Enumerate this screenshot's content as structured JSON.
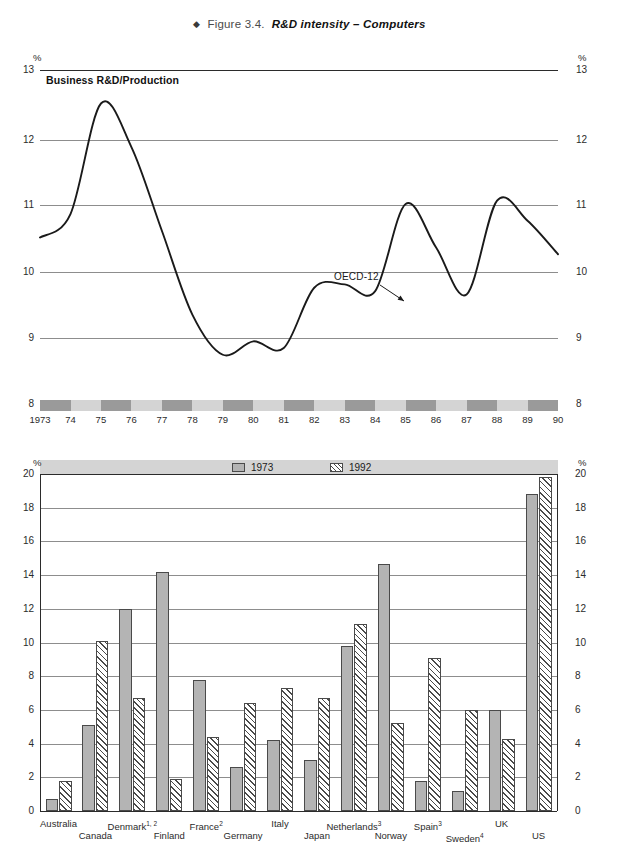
{
  "figure": {
    "bullet": "◆",
    "label": "Figure 3.4.",
    "title": "R&D intensity – Computers"
  },
  "line_panel": {
    "subtitle": "Business R&D/Production",
    "unit": "%",
    "annotation": "OECD-12",
    "y_ticks": [
      "13",
      "12",
      "11",
      "10",
      "9",
      "8"
    ],
    "x_ticks": [
      "1973",
      "74",
      "75",
      "76",
      "77",
      "78",
      "79",
      "80",
      "81",
      "82",
      "83",
      "84",
      "85",
      "86",
      "87",
      "88",
      "89",
      "90"
    ]
  },
  "bar_panel": {
    "unit": "%",
    "y_ticks": [
      "20",
      "18",
      "16",
      "14",
      "12",
      "10",
      "8",
      "6",
      "4",
      "2",
      "0"
    ],
    "legend": [
      {
        "label": "1973",
        "style": "solid"
      },
      {
        "label": "1992",
        "style": "hatch"
      }
    ]
  },
  "colors": {
    "series_1973": "#b4b4b4",
    "series_1992": "#ffffff",
    "hatch": "#4a4a4a",
    "grid": "#8d8d8d",
    "band_dark": "#9a9a9a",
    "band_light": "#d4d4d4",
    "line": "#1a1a1a"
  },
  "chart_data": [
    {
      "type": "line",
      "title": "Business R&D/Production",
      "xlabel": "",
      "ylabel": "%",
      "ylim": [
        8,
        13
      ],
      "xlim": [
        1973,
        1990
      ],
      "grid": true,
      "legend_position": "inline-annotation",
      "series": [
        {
          "name": "OECD-12",
          "x": [
            1973,
            1974,
            1975,
            1976,
            1977,
            1978,
            1979,
            1980,
            1981,
            1982,
            1983,
            1984,
            1985,
            1986,
            1987,
            1988,
            1989,
            1990
          ],
          "values": [
            10.5,
            10.85,
            12.5,
            11.85,
            10.6,
            9.35,
            8.75,
            8.95,
            8.85,
            9.75,
            9.8,
            9.7,
            11.0,
            10.35,
            9.65,
            11.05,
            10.75,
            10.25
          ]
        }
      ]
    },
    {
      "type": "bar",
      "title": "",
      "xlabel": "",
      "ylabel": "%",
      "ylim": [
        0,
        20
      ],
      "grid": true,
      "legend_position": "top",
      "categories": [
        {
          "name": "Australia",
          "note": ""
        },
        {
          "name": "Canada",
          "note": ""
        },
        {
          "name": "Denmark",
          "note": "1, 2"
        },
        {
          "name": "Finland",
          "note": ""
        },
        {
          "name": "France",
          "note": "2"
        },
        {
          "name": "Germany",
          "note": ""
        },
        {
          "name": "Italy",
          "note": ""
        },
        {
          "name": "Japan",
          "note": ""
        },
        {
          "name": "Netherlands",
          "note": "3"
        },
        {
          "name": "Norway",
          "note": ""
        },
        {
          "name": "Spain",
          "note": "3"
        },
        {
          "name": "Sweden",
          "note": "4"
        },
        {
          "name": "UK",
          "note": ""
        },
        {
          "name": "US",
          "note": ""
        }
      ],
      "series": [
        {
          "name": "1973",
          "values": [
            0.7,
            5.1,
            12.0,
            14.2,
            7.8,
            2.6,
            4.2,
            3.0,
            9.8,
            14.65,
            1.8,
            1.2,
            6.0,
            18.8
          ]
        },
        {
          "name": "1992",
          "values": [
            1.8,
            10.1,
            6.7,
            1.9,
            4.4,
            6.4,
            7.3,
            6.7,
            11.1,
            5.2,
            9.1,
            6.0,
            4.25,
            19.8
          ]
        }
      ]
    }
  ]
}
